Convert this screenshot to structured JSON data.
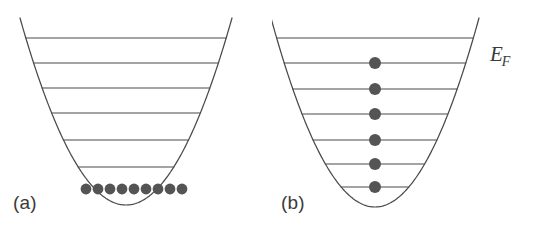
{
  "figure": {
    "width": 544,
    "height": 229,
    "background": "#ffffff",
    "stroke_color": "#4a4a4a",
    "particle_color": "#545454",
    "text_color": "#3a3a3a"
  },
  "panels": [
    {
      "id": "a",
      "label": "(a)",
      "label_x": 13,
      "label_y": 192,
      "well": {
        "shape": "parabola",
        "vertex_x": 126,
        "vertex_y": 205,
        "top_y": 18,
        "half_width_at_top": 106,
        "left_x": 20,
        "right_x": 232
      },
      "levels": [
        {
          "index": 1,
          "y": 38,
          "occupancy": 0
        },
        {
          "index": 2,
          "y": 63,
          "occupancy": 0
        },
        {
          "index": 3,
          "y": 88,
          "occupancy": 0
        },
        {
          "index": 4,
          "y": 113,
          "occupancy": 0
        },
        {
          "index": 5,
          "y": 140,
          "occupancy": 0
        },
        {
          "index": 6,
          "y": 167,
          "occupancy": 0
        }
      ],
      "particles": {
        "count": 9,
        "arrangement": "clustered-at-bottom",
        "y": 189,
        "x_start": 86,
        "x_step": 12,
        "radius": 5.4
      },
      "fermi_label": null
    },
    {
      "id": "b",
      "label": "(b)",
      "label_x": 9,
      "label_y": 192,
      "well": {
        "shape": "parabola",
        "vertex_x": 103,
        "vertex_y": 207,
        "top_y": 18,
        "half_width_at_top": 104,
        "left_x": -1,
        "right_x": 207
      },
      "levels": [
        {
          "index": 1,
          "y": 38,
          "occupancy": 0
        },
        {
          "index": 2,
          "y": 63,
          "occupancy": 1
        },
        {
          "index": 3,
          "y": 89,
          "occupancy": 1
        },
        {
          "index": 4,
          "y": 114,
          "occupancy": 1
        },
        {
          "index": 5,
          "y": 140,
          "occupancy": 1
        },
        {
          "index": 6,
          "y": 164,
          "occupancy": 1
        },
        {
          "index": 7,
          "y": 187,
          "occupancy": 1
        }
      ],
      "particles": {
        "count": 6,
        "arrangement": "one-per-level",
        "x": 103,
        "radius": 6.0,
        "on_levels": [
          2,
          3,
          4,
          5,
          6,
          7
        ]
      },
      "fermi_label": {
        "symbol": "E",
        "subscript": "F",
        "x": 218,
        "y": 42
      }
    }
  ]
}
